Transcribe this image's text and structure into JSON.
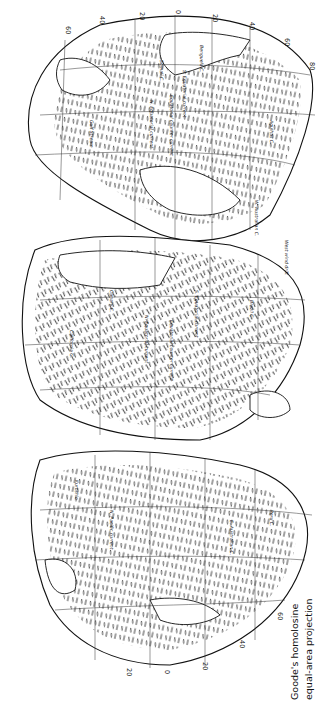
{
  "figure": {
    "type": "map",
    "orientation": "rotated 90 degrees counter-clockwise",
    "caption_line1": "Goode's homolosine",
    "caption_line2": "equal-area projection",
    "background_color": "#ffffff",
    "ink_color": "#111111"
  },
  "lobes": [
    {
      "name": "atlantic-ocean-lobe",
      "label": "Atlantic"
    },
    {
      "name": "indian-ocean-lobe",
      "label": "Indian"
    },
    {
      "name": "pacific-ocean-lobe",
      "label": "Pacific"
    }
  ],
  "top_ticks": [
    "60",
    "40",
    "20",
    "0",
    "20",
    "40",
    "60",
    "80"
  ],
  "bottom_ticks": [
    "20",
    "0",
    "20",
    "40",
    "60"
  ],
  "side_ticks": [
    "60",
    "60",
    "40",
    "0",
    "20",
    "40",
    "60",
    "60"
  ],
  "current_labels": [
    "Benguela C.",
    "Agulhas C.",
    "S. Equatorial current",
    "N. Equatorial current",
    "Equatorial counter current",
    "Somali C.",
    "Gulf Stream",
    "Canary C.",
    "Brazil C.",
    "N. Equatorial current",
    "Equatorial counter current",
    "S. Equatorial current",
    "Kuroshio",
    "California C.",
    "Peru C.",
    "E. Australian C.",
    "W. Australian C.",
    "N. Pacific current",
    "West wind drift"
  ]
}
